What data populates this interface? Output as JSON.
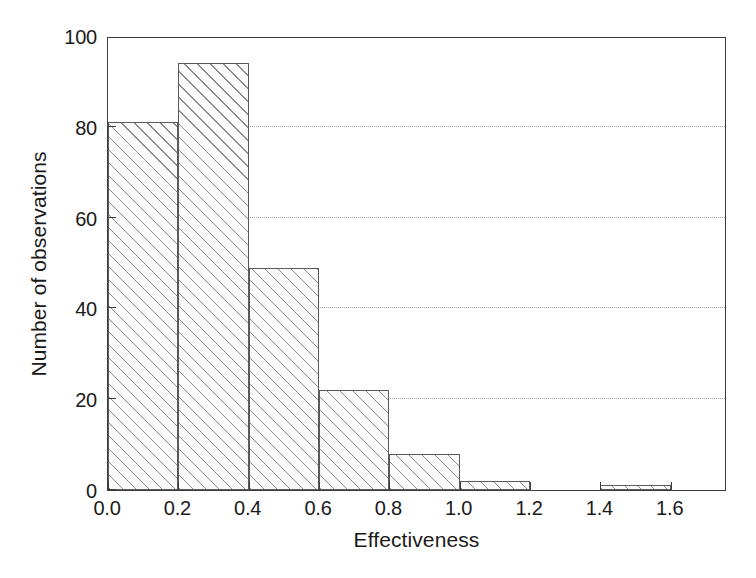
{
  "chart_data": {
    "type": "bar",
    "title": "",
    "subtitle": "",
    "xlabel": "Effectiveness",
    "ylabel": "Number of observations",
    "categories": [
      "0.0-0.2",
      "0.2-0.4",
      "0.4-0.6",
      "0.6-0.8",
      "0.8-1.0",
      "1.0-1.2",
      "1.2-1.4",
      "1.4-1.6"
    ],
    "bin_edges": [
      0.0,
      0.2,
      0.4,
      0.6,
      0.8,
      1.0,
      1.2,
      1.4,
      1.6
    ],
    "values": [
      81,
      94,
      49,
      22,
      8,
      2,
      0,
      1
    ],
    "bin_width": 0.2,
    "xlim": [
      0.0,
      1.76
    ],
    "ylim": [
      0,
      100
    ],
    "xticks": [
      0.0,
      0.2,
      0.4,
      0.6,
      0.8,
      1.0,
      1.2,
      1.4,
      1.6
    ],
    "xticklabels": [
      "0.0",
      "0.2",
      "0.4",
      "0.6",
      "0.8",
      "1.0",
      "1.2",
      "1.4",
      "1.6"
    ],
    "yticks": [
      0,
      20,
      40,
      60,
      80,
      100
    ],
    "yticklabels": [
      "0",
      "20",
      "40",
      "60",
      "80",
      "100"
    ],
    "gridlines_y": [
      20,
      40,
      60,
      80
    ],
    "grid": "horizontal-dotted",
    "legend": "none",
    "bar_fill": "diagonal-hatch",
    "colors": {
      "bar_edge": "#5a5a5a",
      "bar_fill": "#fbfbfb",
      "hatch": "#787878",
      "axis": "#3c3c3c",
      "grid": "#9a9a9a",
      "text": "#1a1a1a",
      "background": "#ffffff"
    }
  }
}
